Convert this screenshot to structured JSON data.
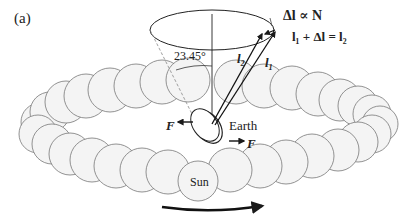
{
  "figure": {
    "panel_label": "(a)",
    "angle_label": "23.45°",
    "equation_proportional": "Δl ∝ N",
    "equation_sum": "l₁ + Δl = l₂",
    "vector_l2": "l₂",
    "vector_l1": "l₁",
    "force_left": "F",
    "force_right": "F",
    "earth_label": "Earth",
    "sun_label": "Sun"
  },
  "colors": {
    "stroke": "#555555",
    "sphere_fill": "#f4f4f4",
    "ink": "#1a1a1a"
  }
}
